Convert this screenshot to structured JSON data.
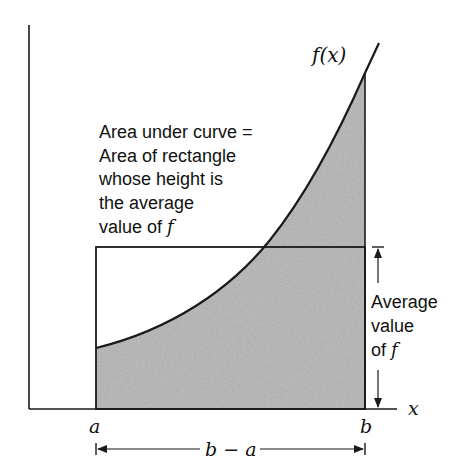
{
  "diagram": {
    "curve_label": "f(x)",
    "x_axis_label": "x",
    "point_a_label": "a",
    "point_b_label": "b",
    "width_label": "b − a",
    "left_annotation": {
      "lines": [
        "Area under curve =",
        "Area of rectangle",
        "whose height is",
        "the average"
      ],
      "last_line_prefix": "value of ",
      "last_line_symbol": "f"
    },
    "right_annotation": {
      "lines": [
        "Average",
        "value"
      ],
      "last_line_prefix": "of ",
      "last_line_symbol": "f"
    },
    "colors": {
      "shade": "#b4b4b4",
      "line": "#1a1a1a",
      "text": "#111111"
    }
  }
}
